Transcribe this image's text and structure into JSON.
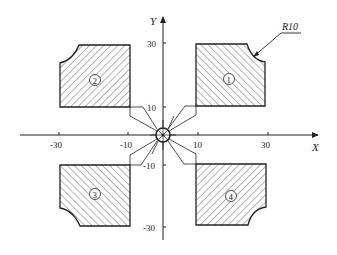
{
  "diagram": {
    "axes": {
      "x_label": "X",
      "y_label": "Y",
      "x_ticks": [
        {
          "label": "-30",
          "value": -30
        },
        {
          "label": "-10",
          "value": -10
        },
        {
          "label": "10",
          "value": 10
        },
        {
          "label": "30",
          "value": 30
        }
      ],
      "y_ticks": [
        {
          "label": "30",
          "value": 30
        },
        {
          "label": "10",
          "value": 10
        },
        {
          "label": "-10",
          "value": -10
        },
        {
          "label": "-30",
          "value": -30
        }
      ]
    },
    "annotation": {
      "radius_label": "R10"
    },
    "regions": [
      {
        "id": "1",
        "label": "1",
        "quadrant": "I",
        "x_range": [
          10,
          30
        ],
        "y_range": [
          10,
          30
        ],
        "rounded_corner": "top-right",
        "hatch": "backslash"
      },
      {
        "id": "2",
        "label": "2",
        "quadrant": "II",
        "x_range": [
          -30,
          -10
        ],
        "y_range": [
          10,
          30
        ],
        "rounded_corner": "top-left",
        "hatch": "slash"
      },
      {
        "id": "3",
        "label": "3",
        "quadrant": "III",
        "x_range": [
          -30,
          -10
        ],
        "y_range": [
          -30,
          -10
        ],
        "rounded_corner": "bottom-left",
        "hatch": "backslash"
      },
      {
        "id": "4",
        "label": "4",
        "quadrant": "IV",
        "x_range": [
          10,
          30
        ],
        "y_range": [
          -30,
          -10
        ],
        "rounded_corner": "bottom-right",
        "hatch": "slash"
      }
    ],
    "colors": {
      "line": "#222222",
      "hatch": "#444444",
      "background": "#ffffff"
    }
  }
}
